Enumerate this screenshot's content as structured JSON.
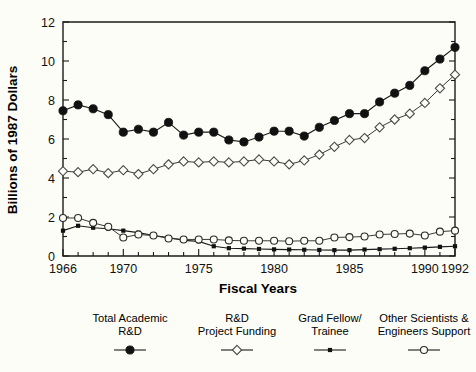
{
  "chart_data": {
    "type": "line",
    "title": "",
    "xlabel": "Fiscal Years",
    "ylabel": "Billions of 1987 Dollars",
    "xlim": [
      1966,
      1992
    ],
    "ylim": [
      0,
      12
    ],
    "grid": false,
    "legend_position": "bottom",
    "x": [
      1966,
      1967,
      1968,
      1969,
      1970,
      1971,
      1972,
      1973,
      1974,
      1975,
      1976,
      1977,
      1978,
      1979,
      1980,
      1981,
      1982,
      1983,
      1984,
      1985,
      1986,
      1987,
      1988,
      1989,
      1990,
      1991,
      1992
    ],
    "xtick_values": [
      1966,
      1970,
      1975,
      1980,
      1985,
      1990,
      1992
    ],
    "xtick_labels": [
      "1966",
      "1970",
      "1975",
      "1980",
      "1985",
      "1990",
      "1992"
    ],
    "ytick_values": [
      0,
      2,
      4,
      6,
      8,
      10,
      12
    ],
    "ytick_labels": [
      "0",
      "2",
      "4",
      "6",
      "8",
      "10",
      "12"
    ],
    "series": [
      {
        "name": "Total Academic R&D",
        "marker": "filled-circle",
        "color": "#111111",
        "values": [
          7.45,
          7.75,
          7.55,
          7.25,
          6.35,
          6.5,
          6.35,
          6.85,
          6.2,
          6.35,
          6.35,
          5.95,
          5.85,
          6.1,
          6.4,
          6.4,
          6.15,
          6.6,
          6.95,
          7.3,
          7.3,
          7.9,
          8.35,
          8.75,
          9.5,
          10.1,
          10.7
        ]
      },
      {
        "name": "R&D Project Funding",
        "marker": "open-diamond",
        "color": "#4a4a4a",
        "values": [
          4.35,
          4.3,
          4.45,
          4.25,
          4.4,
          4.2,
          4.45,
          4.7,
          4.85,
          4.8,
          4.85,
          4.8,
          4.85,
          4.95,
          4.85,
          4.7,
          4.9,
          5.2,
          5.6,
          5.95,
          6.05,
          6.6,
          7.0,
          7.3,
          7.85,
          8.6,
          9.3
        ]
      },
      {
        "name": "Grad Fellow/ Trainee",
        "marker": "small-filled-square",
        "color": "#111111",
        "values": [
          1.3,
          1.55,
          1.45,
          1.4,
          1.3,
          1.2,
          1.05,
          0.95,
          0.8,
          0.75,
          0.5,
          0.4,
          0.38,
          0.36,
          0.34,
          0.33,
          0.32,
          0.31,
          0.3,
          0.3,
          0.33,
          0.35,
          0.37,
          0.4,
          0.43,
          0.47,
          0.5
        ]
      },
      {
        "name": "Other Scientists & Engineers Support",
        "marker": "open-circle",
        "color": "#2a2a2a",
        "values": [
          1.95,
          1.95,
          1.7,
          1.5,
          0.95,
          1.1,
          1.05,
          0.9,
          0.85,
          0.85,
          0.85,
          0.8,
          0.78,
          0.78,
          0.78,
          0.76,
          0.78,
          0.78,
          0.95,
          0.97,
          1.0,
          1.1,
          1.13,
          1.15,
          1.05,
          1.25,
          1.3
        ]
      }
    ]
  },
  "legend": {
    "entries": [
      {
        "line1": "Total Academic",
        "line2": "R&D",
        "marker": "filled-circle"
      },
      {
        "line1": "R&D",
        "line2": "Project Funding",
        "marker": "open-diamond"
      },
      {
        "line1": "Grad Fellow/",
        "line2": "Trainee",
        "marker": "small-filled-square"
      },
      {
        "line1": "Other Scientists &",
        "line2": "Engineers Support",
        "marker": "open-circle"
      }
    ]
  }
}
